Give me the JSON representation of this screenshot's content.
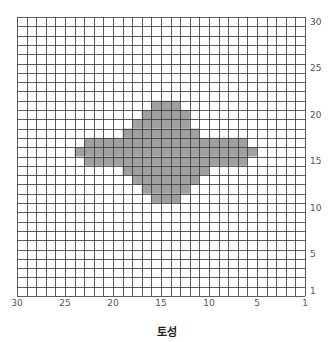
{
  "chart_data": {
    "type": "heatmap",
    "title": "토성",
    "xlabel": "",
    "ylabel": "",
    "grid": true,
    "cols": 30,
    "rows": 30,
    "x_axis": {
      "direction": "descending",
      "ticks": [
        30,
        25,
        20,
        15,
        10,
        5,
        1
      ]
    },
    "y_axis": {
      "position": "right",
      "ticks": [
        30,
        25,
        20,
        15,
        10,
        5,
        1
      ]
    },
    "fill_color": "#a0a0a0",
    "line_color": "#333333",
    "filled_rows": [
      {
        "y": 21,
        "x_from": 16,
        "x_to": 14
      },
      {
        "y": 20,
        "x_from": 17,
        "x_to": 13
      },
      {
        "y": 19,
        "x_from": 18,
        "x_to": 13
      },
      {
        "y": 18,
        "x_from": 19,
        "x_to": 12
      },
      {
        "y": 17,
        "x_from": 23,
        "x_to": 7
      },
      {
        "y": 16,
        "x_from": 24,
        "x_to": 6
      },
      {
        "y": 15,
        "x_from": 23,
        "x_to": 7
      },
      {
        "y": 14,
        "x_from": 19,
        "x_to": 11
      },
      {
        "y": 13,
        "x_from": 18,
        "x_to": 12
      },
      {
        "y": 12,
        "x_from": 17,
        "x_to": 13
      },
      {
        "y": 11,
        "x_from": 16,
        "x_to": 14
      }
    ]
  }
}
